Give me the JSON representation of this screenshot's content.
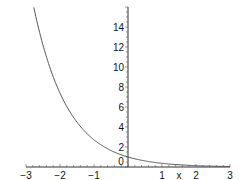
{
  "chart_data": {
    "type": "line",
    "title": "",
    "xlabel": "x",
    "ylabel": "",
    "xlim": [
      -3,
      3
    ],
    "ylim": [
      0,
      16
    ],
    "grid": false,
    "legend": null,
    "x_ticks": [
      "-3",
      "-2",
      "-1",
      "0",
      "1",
      "2",
      "3"
    ],
    "y_ticks": [
      "2",
      "4",
      "6",
      "8",
      "10",
      "12",
      "14"
    ],
    "series": [
      {
        "name": "exp(-x)",
        "x": [
          -2.77,
          -2.5,
          -2,
          -1.5,
          -1,
          -0.5,
          0,
          0.5,
          1,
          1.5,
          2,
          2.5,
          3
        ],
        "values": [
          16.0,
          12.18,
          7.39,
          4.48,
          2.72,
          1.65,
          1.0,
          0.61,
          0.37,
          0.22,
          0.14,
          0.08,
          0.05
        ],
        "color": "#555555"
      }
    ]
  }
}
